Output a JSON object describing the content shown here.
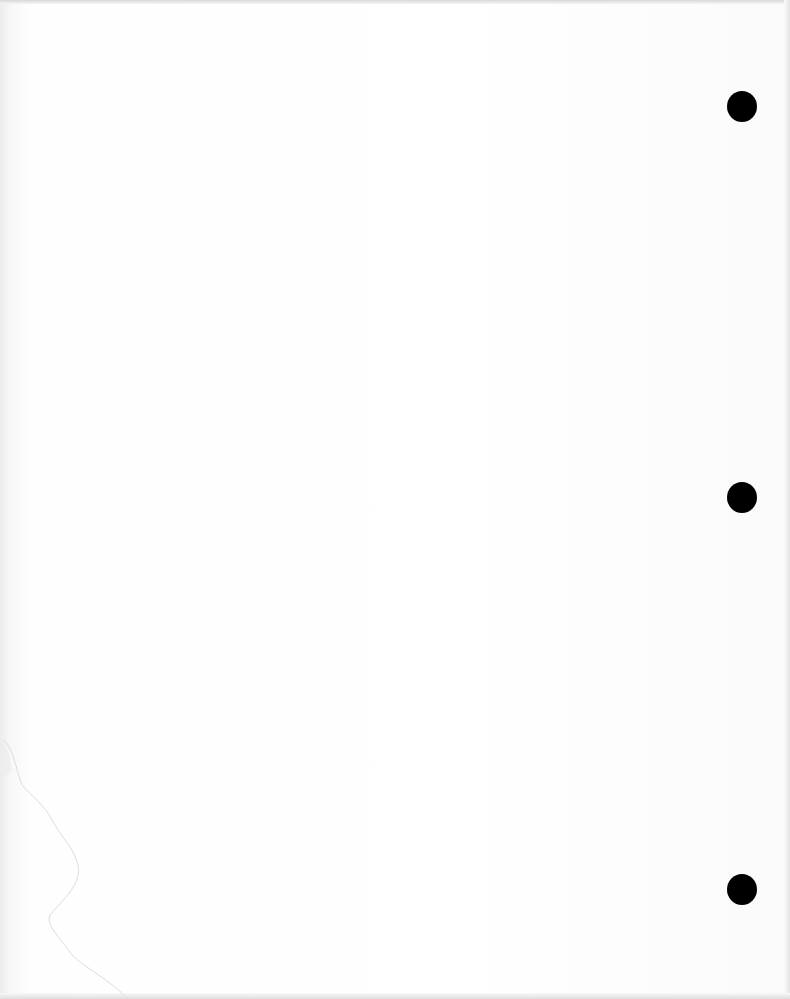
{
  "document": {
    "type": "scanned blank page",
    "text": "",
    "punch_holes": [
      {
        "label": "top",
        "x": 727,
        "y": 91
      },
      {
        "label": "middle",
        "x": 727,
        "y": 482
      },
      {
        "label": "bottom",
        "x": 727,
        "y": 874
      }
    ],
    "colors": {
      "paper": "#ffffff",
      "hole": "#000000"
    }
  }
}
